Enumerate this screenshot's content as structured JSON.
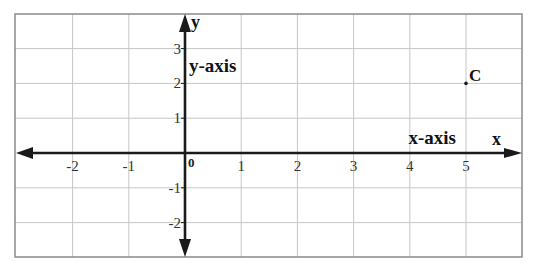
{
  "diagram": {
    "type": "coordinate-plane",
    "x_range": [
      -3,
      6
    ],
    "y_range": [
      -3,
      4
    ],
    "x_ticks": [
      -2,
      -1,
      1,
      2,
      3,
      4,
      5
    ],
    "y_ticks": [
      3,
      2,
      1,
      -1,
      -2
    ],
    "x_tick_labels": [
      "-2",
      "-1",
      "1",
      "2",
      "3",
      "4",
      "5"
    ],
    "y_tick_labels": [
      "3",
      "2",
      "1",
      "-1",
      "-2"
    ],
    "origin_label": "0",
    "x_axis_letter": "x",
    "y_axis_letter": "y",
    "x_axis_name": "x-axis",
    "y_axis_name": "y-axis",
    "points": [
      {
        "label": "C",
        "x": 5,
        "y": 2
      }
    ],
    "colors": {
      "grid": "#c6c6c6",
      "border": "#8a8a8a",
      "axis": "#1a1a1a",
      "text": "#111111"
    }
  }
}
